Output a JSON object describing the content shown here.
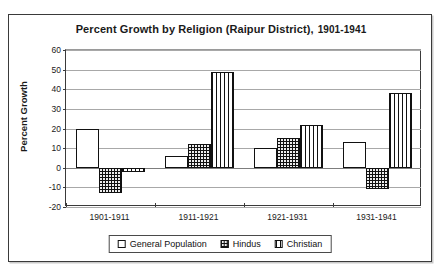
{
  "chart_data": {
    "type": "bar",
    "title": "Percent Growth by Religion (Raipur District),",
    "title_range": "1901-1941",
    "xlabel": "",
    "ylabel": "Percent Growth",
    "categories": [
      "1901-1911",
      "1911-1921",
      "1921-1931",
      "1931-1941"
    ],
    "series": [
      {
        "name": "General Population",
        "pattern": "dotted-white",
        "values": [
          20,
          6,
          10,
          13
        ]
      },
      {
        "name": "Hindus",
        "pattern": "dotted-black",
        "values": [
          -13,
          12,
          15,
          -11
        ]
      },
      {
        "name": "Christian",
        "pattern": "vertical-lines",
        "values": [
          -2,
          49,
          22,
          38
        ]
      }
    ],
    "ylim": [
      -20,
      60
    ],
    "yticks": [
      60,
      50,
      40,
      30,
      20,
      10,
      0,
      -10,
      -20
    ],
    "ytick_labels": [
      "60",
      "50",
      "40",
      "30",
      "20",
      "10",
      "0",
      "-10",
      "-20"
    ],
    "grid": true,
    "legend_position": "bottom"
  },
  "legend": {
    "items": [
      {
        "label": "General Population"
      },
      {
        "label": "Hindus"
      },
      {
        "label": "Christian"
      }
    ]
  }
}
